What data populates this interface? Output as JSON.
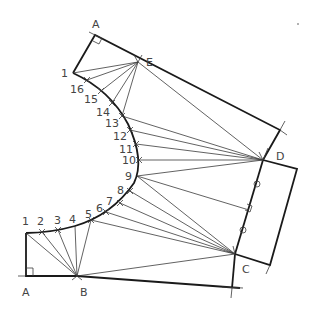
{
  "diagram": {
    "type": "sheet-metal-development",
    "points": {
      "A_top": [
        95,
        35
      ],
      "E": [
        138,
        62
      ],
      "P1_top": [
        73,
        73
      ],
      "corner_ED": [
        280,
        130
      ],
      "D": [
        263,
        160
      ],
      "corner_right_top": [
        297,
        169
      ],
      "corner_right_bottom": [
        270,
        265
      ],
      "C": [
        235,
        254
      ],
      "B": [
        77,
        276
      ],
      "A_bottom": [
        26,
        276
      ],
      "P1_bottom": [
        26,
        233
      ],
      "bottom_end": [
        240,
        288
      ]
    },
    "curve_points": [
      {
        "label": "1",
        "xy": [
          73,
          73
        ],
        "lx": 61,
        "ly": 77
      },
      {
        "label": "16",
        "xy": [
          87,
          80
        ],
        "lx": 70,
        "ly": 93
      },
      {
        "label": "15",
        "xy": [
          101,
          91
        ],
        "lx": 84,
        "ly": 103
      },
      {
        "label": "14",
        "xy": [
          112,
          103
        ],
        "lx": 97,
        "ly": 116
      },
      {
        "label": "13",
        "xy": [
          122,
          116
        ],
        "lx": 105,
        "ly": 127
      },
      {
        "label": "12",
        "xy": [
          130,
          130
        ],
        "lx": 113,
        "ly": 140
      },
      {
        "label": "11",
        "xy": [
          136,
          144
        ],
        "lx": 120,
        "ly": 153
      },
      {
        "label": "10",
        "xy": [
          139,
          160
        ],
        "lx": 122,
        "ly": 164
      },
      {
        "label": "9",
        "xy": [
          137,
          176
        ],
        "lx": 126,
        "ly": 180
      },
      {
        "label": "8",
        "xy": [
          130,
          191
        ],
        "lx": 117,
        "ly": 195
      },
      {
        "label": "7",
        "xy": [
          120,
          203
        ],
        "lx": 107,
        "ly": 205
      },
      {
        "label": "6",
        "xy": [
          106,
          212
        ],
        "lx": 97,
        "ly": 212
      },
      {
        "label": "5",
        "xy": [
          91,
          220
        ],
        "lx": 85,
        "ly": 218
      },
      {
        "label": "4",
        "xy": [
          75,
          226
        ],
        "lx": 70,
        "ly": 223
      },
      {
        "label": "3",
        "xy": [
          58,
          230
        ],
        "lx": 54,
        "ly": 225
      },
      {
        "label": "2",
        "xy": [
          42,
          232
        ],
        "lx": 38,
        "ly": 226
      },
      {
        "label": "1",
        "xy": [
          26,
          233
        ],
        "lx": 22,
        "ly": 226
      }
    ],
    "labels": {
      "A_top": "A",
      "E": "E",
      "D": "D",
      "C": "C",
      "B": "B",
      "A_bottom": "A"
    }
  }
}
